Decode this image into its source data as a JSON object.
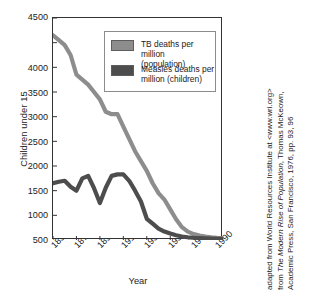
{
  "chart_data": {
    "type": "line",
    "title": "",
    "xlabel": "Year",
    "ylabel": "Children under 15",
    "xlim": [
      1850,
      1995
    ],
    "ylim": [
      0,
      4500
    ],
    "xticks": [
      "1850",
      "1870",
      "1890",
      "1910",
      "1930",
      "1950",
      "1970",
      "1990"
    ],
    "xtick_values": [
      1850,
      1870,
      1890,
      1910,
      1930,
      1950,
      1970,
      1990
    ],
    "yticks": [
      "500",
      "1000",
      "1500",
      "2000",
      "2500",
      "3000",
      "3500",
      "4000",
      "4500"
    ],
    "ytick_values": [
      500,
      1000,
      1500,
      2000,
      2500,
      3000,
      3500,
      4000,
      4500
    ],
    "grid": false,
    "legend_position": "top-right-inside",
    "series": [
      {
        "name": "TB deaths per million (population)",
        "color": "#8d8d8d",
        "x": [
          1850,
          1855,
          1860,
          1865,
          1870,
          1875,
          1880,
          1885,
          1890,
          1895,
          1900,
          1905,
          1910,
          1915,
          1920,
          1925,
          1930,
          1935,
          1940,
          1945,
          1950,
          1955,
          1960,
          1965,
          1970,
          1975,
          1980,
          1985,
          1990,
          1994
        ],
        "values": [
          4150,
          4050,
          3950,
          3750,
          3350,
          3250,
          3150,
          3000,
          2850,
          2600,
          2550,
          2550,
          2300,
          2050,
          1800,
          1600,
          1400,
          1150,
          950,
          820,
          620,
          420,
          260,
          170,
          120,
          90,
          70,
          55,
          45,
          40
        ]
      },
      {
        "name": "Measles deaths per million (children)",
        "color": "#4d4d4d",
        "x": [
          1850,
          1855,
          1860,
          1865,
          1870,
          1875,
          1880,
          1885,
          1890,
          1895,
          1900,
          1905,
          1910,
          1915,
          1920,
          1925,
          1930,
          1935,
          1940,
          1945,
          1950,
          1955,
          1960,
          1965,
          1970,
          1975,
          1980,
          1985,
          1990,
          1994
        ],
        "values": [
          1150,
          1180,
          1200,
          1080,
          1000,
          1250,
          1300,
          1050,
          750,
          1060,
          1300,
          1330,
          1330,
          1200,
          1000,
          780,
          430,
          330,
          230,
          170,
          130,
          95,
          70,
          55,
          45,
          38,
          32,
          28,
          25,
          22
        ]
      }
    ]
  },
  "legend": {
    "items": [
      {
        "label": "TB deaths per million\n(population)",
        "color": "#8d8d8d"
      },
      {
        "label": "Measles deaths per\nmillion (children)",
        "color": "#4d4d4d"
      }
    ]
  },
  "credit": {
    "line1": "adapted from World Resources Institute at <www.wri.org>",
    "line2_prefix": "from ",
    "line2_italic": "The Modern Rise of Population",
    "line2_suffix": ", Thomas McKeown,",
    "line3": "Academic Press, San Francisco, 1976, pp. 93, 96"
  },
  "colors": {
    "tb": "#8d8d8d",
    "measles": "#4d4d4d",
    "axis": "#333333",
    "legend_border": "#8c8c8c"
  }
}
